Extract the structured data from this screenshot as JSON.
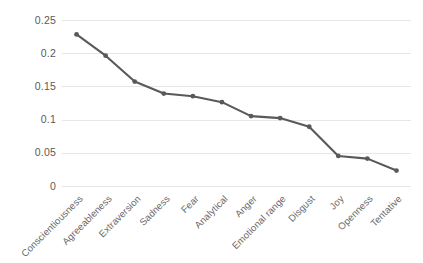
{
  "chart_data": {
    "type": "line",
    "title": "",
    "xlabel": "",
    "ylabel": "",
    "categories": [
      "Conscientiousness",
      "Agreeableness",
      "Extraversion",
      "Sadness",
      "Fear",
      "Analytical",
      "Anger",
      "Emotional range",
      "Disgust",
      "Joy",
      "Openness",
      "Tentative"
    ],
    "values": [
      0.229,
      0.197,
      0.158,
      0.14,
      0.136,
      0.127,
      0.106,
      0.103,
      0.09,
      0.046,
      0.042,
      0.024
    ],
    "ylim": [
      0,
      0.25
    ],
    "yticks": [
      0,
      0.05,
      0.1,
      0.15,
      0.2,
      0.25
    ],
    "ytick_labels": [
      "0",
      "0.05",
      "0.1",
      "0.15",
      "0.2",
      "0.25"
    ],
    "grid": true,
    "grid_axis": "y",
    "legend": false,
    "legend_position": "none",
    "marker": "circle",
    "series_color": "#595959",
    "grid_color": "#e6e6e6",
    "background_color": "#ffffff",
    "tick_label_color": "#5a5a5a"
  }
}
